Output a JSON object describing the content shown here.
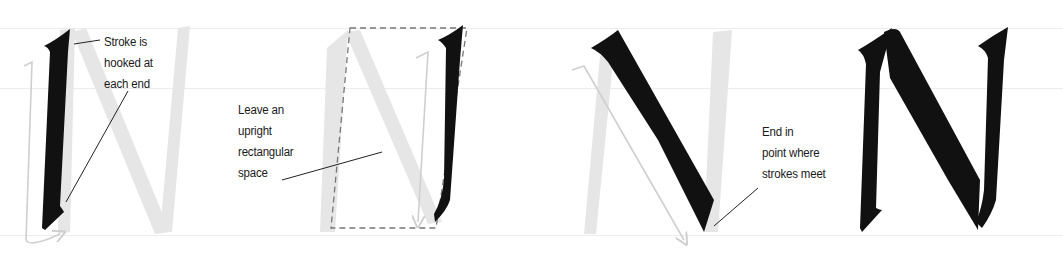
{
  "diagram": {
    "colors": {
      "ink": "#111111",
      "ghost_letter": "#e2e2e2",
      "arrow_trace": "#cfcfcf",
      "guide_line": "#ececec",
      "dashed_box": "#777777",
      "leader_line": "#222222",
      "text": "#1a1a1a"
    },
    "guide_lines_y": [
      28,
      88,
      235
    ],
    "steps": [
      {
        "step": 1,
        "stroke": "left vertical stroke",
        "annotation": {
          "lines": [
            "Stroke is",
            "hooked at",
            "each end"
          ]
        }
      },
      {
        "step": 2,
        "stroke": "right vertical stroke",
        "annotation": {
          "lines": [
            "Leave an",
            "upright",
            "rectangular",
            "space"
          ]
        }
      },
      {
        "step": 3,
        "stroke": "diagonal stroke",
        "annotation": {
          "lines": [
            "End in",
            "point where",
            "strokes meet"
          ]
        }
      },
      {
        "step": 4,
        "stroke": "completed letter N",
        "annotation": null
      }
    ]
  }
}
